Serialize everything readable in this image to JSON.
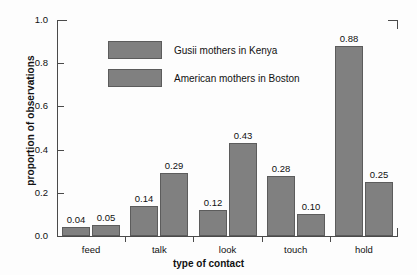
{
  "chart_data": {
    "type": "bar",
    "title": "",
    "xlabel": "type of contact",
    "ylabel": "proportion of observations",
    "categories": [
      "feed",
      "talk",
      "look",
      "touch",
      "hold"
    ],
    "series": [
      {
        "name": "Gusii mothers in Kenya",
        "values": [
          0.04,
          0.14,
          0.12,
          0.28,
          0.88
        ]
      },
      {
        "name": "American mothers in Boston",
        "values": [
          0.05,
          0.29,
          0.43,
          0.1,
          0.25
        ]
      }
    ],
    "value_labels": [
      [
        "0.04",
        "0.14",
        "0.12",
        "0.28",
        "0.88"
      ],
      [
        "0.05",
        "0.29",
        "0.43",
        "0.10",
        "0.25"
      ]
    ],
    "ylim": [
      0.0,
      1.0
    ],
    "yticks": [
      0.0,
      0.2,
      0.4,
      0.6,
      0.8,
      1.0
    ],
    "ytick_labels": [
      "0.0",
      "0.2",
      "0.4",
      "0.6",
      "0.8",
      "1.0"
    ],
    "grid": false,
    "legend_position": "upper-left-inside",
    "bar_color": "#808080",
    "bar_edge_color": "#5c5c5c",
    "axis_color": "#4a4a4a"
  },
  "legend": {
    "entries": [
      {
        "label": "Gusii mothers in Kenya"
      },
      {
        "label": "American mothers in Boston"
      }
    ]
  }
}
